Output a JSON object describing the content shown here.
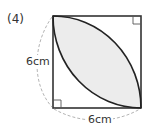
{
  "problem": {
    "number_label": "(4)"
  },
  "figure": {
    "shape": "square with two quarter-circle arcs forming shaded lens",
    "side_left_label": "6cm",
    "side_bottom_label": "6cm",
    "shade_color": "#ececec",
    "line_color": "#333333",
    "dash_color": "#aaaaaa",
    "right_angle_marks": [
      "top-right",
      "bottom-left"
    ]
  }
}
